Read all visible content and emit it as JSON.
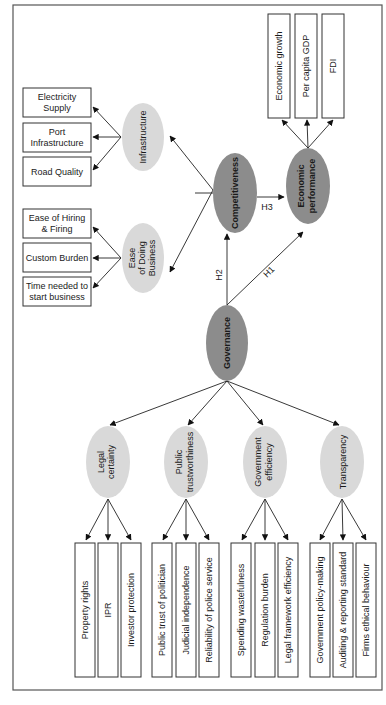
{
  "colors": {
    "dark_node": "#8c8c8c",
    "light_node": "#d9d9d9",
    "box_border": "#333333",
    "edge": "#222222",
    "frame": "#555555"
  },
  "nodes": {
    "governance": "Governance",
    "competitiveness": "Competitiveness",
    "economic_performance": [
      "Economic",
      "performance"
    ],
    "infrastructure": "Infrastructure",
    "ease_of_doing_business": [
      "Ease",
      "of Doing",
      "Business"
    ],
    "legal_certainty": [
      "Legal",
      "certainty"
    ],
    "public_trustworthiness": [
      "Public",
      "trustworthiness"
    ],
    "government_efficiency": [
      "Government",
      "efficiency"
    ],
    "transparency": "Transparency"
  },
  "paths": {
    "h1": "H1",
    "h2": "H2",
    "h3": "H3"
  },
  "indicators": {
    "economic_performance": [
      "Economic growth",
      "Per capita GDP",
      "FDI"
    ],
    "infrastructure": [
      [
        "Electricity",
        "Supply"
      ],
      [
        "Port",
        "Infrastructure"
      ],
      [
        "Road Quality"
      ]
    ],
    "ease_of_doing_business": [
      [
        "Ease of Hiring",
        "& Firing"
      ],
      [
        "Custom Burden"
      ],
      [
        "Time needed to",
        "start business"
      ]
    ],
    "legal_certainty": [
      "Property rights",
      "IPR",
      "Investor protection"
    ],
    "public_trustworthiness": [
      "Public trust of politician",
      "Judicial independence",
      "Reliability of police service"
    ],
    "government_efficiency": [
      "Spending wastefulness",
      "Regulation burden",
      "Legal framework efficiency"
    ],
    "transparency": [
      "Government policy-making",
      "Auditing & reporting standard",
      "Firms ethical behaviour"
    ]
  }
}
